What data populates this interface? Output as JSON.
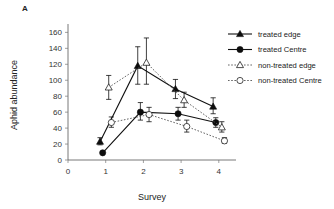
{
  "panel": {
    "label": "A"
  },
  "chart_data": {
    "type": "line",
    "title": "",
    "xlabel": "Survey",
    "ylabel": "Aphid abundance",
    "x": [
      1,
      2,
      3,
      4
    ],
    "xlim": [
      0,
      4.35
    ],
    "ylim": [
      0,
      168
    ],
    "xticks": [
      "0",
      "1",
      "2",
      "3",
      "4"
    ],
    "xtick_values": [
      0,
      1,
      2,
      3,
      4
    ],
    "yticks": [
      "0",
      "20",
      "40",
      "60",
      "80",
      "100",
      "120",
      "140",
      "160"
    ],
    "ytick_values": [
      0,
      20,
      40,
      60,
      80,
      100,
      120,
      140,
      160
    ],
    "grid": false,
    "legend_position": "top-right",
    "series": [
      {
        "name": "treated edge",
        "marker": "filled-triangle",
        "linestyle": "solid",
        "color": "#0d0d0d",
        "x_offset": -0.15,
        "values": [
          23,
          118,
          89,
          67
        ],
        "err_low": [
          19,
          95,
          77,
          58
        ],
        "err_high": [
          28,
          142,
          101,
          78
        ]
      },
      {
        "name": "treated Centre",
        "marker": "filled-circle",
        "linestyle": "solid",
        "color": "#0d0d0d",
        "x_offset": -0.08,
        "values": [
          9,
          60,
          58,
          47
        ],
        "err_low": [
          9,
          50,
          50,
          41
        ],
        "err_high": [
          9,
          72,
          66,
          53
        ]
      },
      {
        "name": "non-treated edge",
        "marker": "open-triangle",
        "linestyle": "dotted",
        "color": "#333333",
        "x_offset": 0.08,
        "values": [
          91,
          122,
          75,
          41
        ],
        "err_low": [
          76,
          95,
          66,
          35
        ],
        "err_high": [
          106,
          153,
          85,
          48
        ]
      },
      {
        "name": "non-treated Centre",
        "marker": "open-circle",
        "linestyle": "dotted",
        "color": "#333333",
        "x_offset": 0.15,
        "values": [
          47,
          57,
          42,
          24
        ],
        "err_low": [
          41,
          48,
          35,
          21
        ],
        "err_high": [
          54,
          66,
          50,
          28
        ]
      }
    ]
  },
  "legend": {
    "items": [
      {
        "label": "treated edge"
      },
      {
        "label": "treated Centre"
      },
      {
        "label": "non-treated edge"
      },
      {
        "label": "non-treated Centre"
      }
    ]
  }
}
